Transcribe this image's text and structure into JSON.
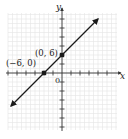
{
  "chart_data": {
    "type": "line",
    "title": "",
    "xlabel": "x",
    "ylabel": "y",
    "origin_label": "0",
    "grid": true,
    "tick_step": 3,
    "xlim": [
      -18,
      18
    ],
    "ylim": [
      -18,
      21
    ],
    "series": [
      {
        "name": "line through (-6, 0) and (0, 6)",
        "equation": "y = x + 6",
        "x": [
          -17,
          12
        ],
        "y": [
          -11,
          18
        ],
        "arrows": "both"
      }
    ],
    "points": [
      {
        "label": "(0, 6)",
        "x": 0,
        "y": 6
      },
      {
        "label": "(−6, 0)",
        "x": -6,
        "y": 0
      }
    ]
  },
  "colors": {
    "axis": "#333333",
    "grid": "#e4e4e4",
    "line": "#1a1a1a",
    "text": "#222222"
  }
}
